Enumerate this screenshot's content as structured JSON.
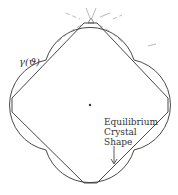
{
  "diagram": {
    "type": "wulff-construction",
    "labels": {
      "gamma": "γ(ϑ)",
      "ecs": [
        "Equilibrium",
        "Crystal",
        "Shape"
      ]
    },
    "colors": {
      "line": "#333333",
      "faint": "#9a9a9a",
      "background": "#ffffff"
    }
  }
}
